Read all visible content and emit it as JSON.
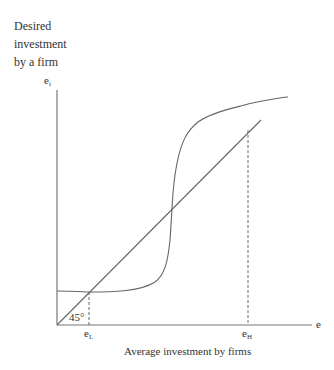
{
  "diagram": {
    "y_axis_label_lines": [
      "Desired",
      "investment",
      "by a firm"
    ],
    "y_axis_symbol": "e",
    "y_axis_symbol_sub": "i",
    "x_axis_symbol": "e",
    "x_axis_label": "Average investment by firms",
    "angle_label": "45°",
    "equilibria": [
      {
        "symbol": "e",
        "sub": "L",
        "name": "low equilibrium"
      },
      {
        "symbol": "e",
        "sub": "H",
        "name": "high equilibrium"
      }
    ],
    "curves": [
      {
        "name": "45-degree line",
        "description": "e_i = e"
      },
      {
        "name": "desired investment curve",
        "description": "S-shaped curve crossing 45° line three times"
      }
    ],
    "line_color": "#666666"
  }
}
